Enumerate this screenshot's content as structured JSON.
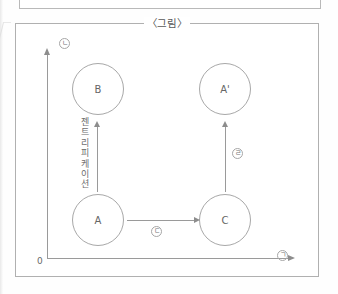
{
  "figure": {
    "title": "〈그림〉",
    "origin_label": "0"
  },
  "axes": {
    "y_marker": "ㄴ",
    "x_marker": "ㄱ",
    "y_arrow_icon": "arrow-up-icon",
    "x_arrow_icon": "arrow-right-icon"
  },
  "nodes": [
    {
      "id": "B",
      "label": "B"
    },
    {
      "id": "Ap",
      "label": "A'"
    },
    {
      "id": "A",
      "label": "A"
    },
    {
      "id": "C",
      "label": "C"
    }
  ],
  "arrows": [
    {
      "id": "a-to-b",
      "label": "젠트리피케이션",
      "marker": "",
      "icon": "arrow-up-icon"
    },
    {
      "id": "a-to-c",
      "label": "",
      "marker": "ㄷ",
      "icon": "arrow-right-icon"
    },
    {
      "id": "c-to-ap",
      "label": "",
      "marker": "ㄹ",
      "icon": "arrow-up-icon"
    }
  ],
  "vertical_caption_chars": [
    "젠",
    "트",
    "리",
    "피",
    "케",
    "이",
    "션"
  ],
  "colors": {
    "line": "#a8a8a8",
    "axis": "#9a9a9a",
    "text": "#666666",
    "frame": "#b0b0b0",
    "page_bg": "#fefefe"
  }
}
